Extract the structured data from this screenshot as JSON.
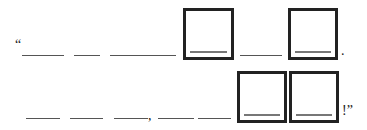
{
  "puzzle": {
    "row1": {
      "open_quote": "“",
      "dash": "—",
      "period": "."
    },
    "row2": {
      "comma": ",",
      "end": "!”"
    }
  }
}
